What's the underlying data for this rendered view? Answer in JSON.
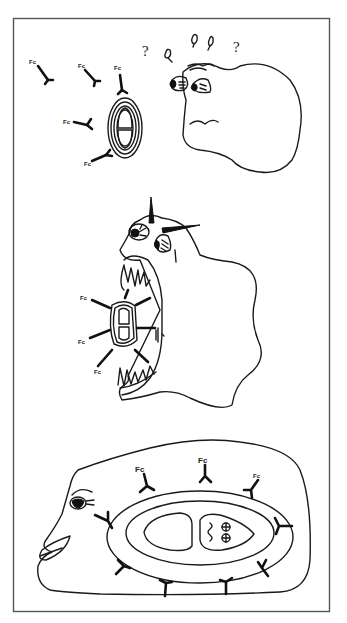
{
  "figure": {
    "type": "hand-drawn cartoon illustration",
    "panels": [
      {
        "id": "panel-1-encounter",
        "description": "Antibodies approach an encapsulated cell; a confused phagocyte with eyes looks on",
        "antibody_label": "Fc",
        "antibody_count": 5,
        "question_marks": [
          "?",
          "?",
          "?",
          "?",
          "?"
        ]
      },
      {
        "id": "panel-2-engulfment",
        "description": "Phagocyte with fanged open mouth engulfing the antibody-coated cell",
        "antibody_label": "Fc",
        "antibody_count": 6
      },
      {
        "id": "panel-3-digestion",
        "description": "Smiling phagocyte containing the ingested cell with Fc-tagged antibodies around its capsule",
        "antibody_label": "Fc",
        "antibody_count": 11,
        "inner_symbols": [
          "⊕",
          "⊕"
        ]
      }
    ],
    "labels": {
      "fc": "Fc",
      "fc_small": "Fc",
      "question": "?"
    },
    "colors": {
      "ink": "#1a1a1a",
      "background": "#ffffff",
      "frame": "#555555"
    }
  }
}
